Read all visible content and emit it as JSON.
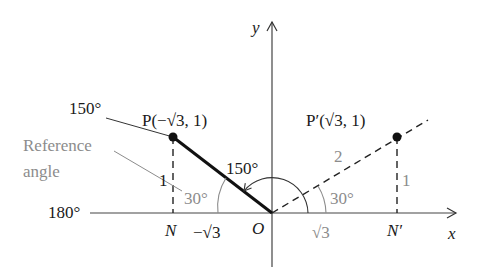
{
  "figure": {
    "type": "unit-circle reference angle diagram",
    "colors": {
      "ink": "#1a1a1a",
      "reference": "#8c8c8c",
      "background": "#ffffff"
    }
  },
  "axes": {
    "x_label": "x",
    "y_label": "y",
    "origin_label": "O"
  },
  "points": {
    "P": {
      "label": "P(−√3, 1)",
      "foot_label": "N"
    },
    "P_prime": {
      "label": "P′(√3, 1)",
      "foot_label": "N′"
    }
  },
  "angles": {
    "terminal_label": "150°",
    "arc_label": "150°",
    "straight_label": "180°",
    "reference_left": "30°",
    "reference_right": "30°"
  },
  "segments": {
    "left_height": "1",
    "right_height": "1",
    "left_base": "−√3",
    "right_base": "√3",
    "hypotenuse": "2"
  },
  "annotations": {
    "reference_line1": "Reference",
    "reference_line2": "angle"
  }
}
